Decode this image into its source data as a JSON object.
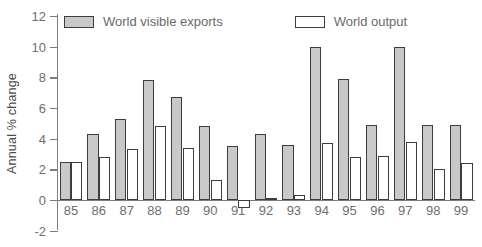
{
  "chart_data": {
    "type": "bar",
    "title": "",
    "xlabel": "",
    "ylabel": "Annual % change",
    "ylim": [
      -2,
      12
    ],
    "yticks": [
      12,
      10,
      8,
      6,
      4,
      2,
      0,
      -2
    ],
    "grid": false,
    "legend_position": "top",
    "categories": [
      "85",
      "86",
      "87",
      "88",
      "89",
      "90",
      "91",
      "92",
      "93",
      "94",
      "95",
      "96",
      "97",
      "98",
      "99"
    ],
    "series": [
      {
        "name": "World visible exports",
        "color": "#c9c9c9",
        "values": [
          2.5,
          4.3,
          5.3,
          7.8,
          6.7,
          4.8,
          3.5,
          4.3,
          3.6,
          10.0,
          7.9,
          4.9,
          10.0,
          4.9,
          4.9
        ]
      },
      {
        "name": "World output",
        "color": "#ffffff",
        "values": [
          2.5,
          2.8,
          3.3,
          4.8,
          3.4,
          1.3,
          -0.5,
          0.1,
          0.3,
          3.7,
          2.8,
          2.9,
          3.8,
          2.0,
          2.4
        ]
      }
    ]
  },
  "axis": {
    "y_label": "Annual % change"
  },
  "legend": {
    "items": [
      {
        "label": "World visible exports",
        "swatch": "gray"
      },
      {
        "label": "World output",
        "swatch": "white"
      }
    ]
  },
  "colors": {
    "bar_gray_fill": "#c9c9c9",
    "bar_white_fill": "#ffffff",
    "bar_stroke": "#3d3d3d",
    "axis": "#7d7d7d",
    "text": "#6e6e6e"
  }
}
